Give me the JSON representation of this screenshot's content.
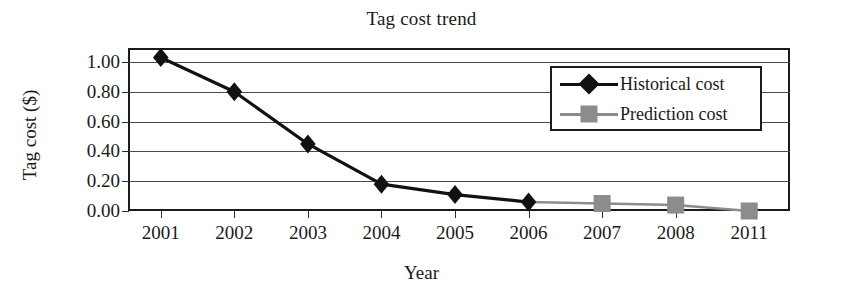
{
  "chart_data": {
    "type": "line",
    "title": "Tag cost trend",
    "xlabel": "Year",
    "ylabel": "Tag cost ($)",
    "categories": [
      "2001",
      "2002",
      "2003",
      "2004",
      "2005",
      "2006",
      "2007",
      "2008",
      "2011"
    ],
    "ylim": [
      0.0,
      1.0
    ],
    "yticks": [
      "0.00",
      "0.20",
      "0.40",
      "0.60",
      "0.80",
      "1.00"
    ],
    "ytick_values": [
      0.0,
      0.2,
      0.4,
      0.6,
      0.8,
      1.0
    ],
    "grid": true,
    "legend_position": "top-right",
    "series": [
      {
        "name": "Historical cost",
        "marker": "diamond",
        "color": "#111111",
        "values": [
          1.03,
          0.8,
          0.45,
          0.18,
          0.11,
          0.06,
          null,
          null,
          null
        ]
      },
      {
        "name": "Prediction cost",
        "marker": "square",
        "color": "#8c8c8c",
        "values": [
          null,
          null,
          null,
          null,
          null,
          0.06,
          0.05,
          0.04,
          0.0
        ]
      }
    ]
  },
  "legend": {
    "items": [
      {
        "label": "Historical cost",
        "marker": "diamond-marker",
        "color": "#111111"
      },
      {
        "label": "Prediction cost",
        "marker": "square-marker",
        "color": "#8c8c8c"
      }
    ]
  },
  "colors": {
    "historical": "#111111",
    "prediction": "#8c8c8c",
    "axis": "#1b1b1b",
    "grid": "#4a4a4a",
    "background": "#ffffff"
  }
}
